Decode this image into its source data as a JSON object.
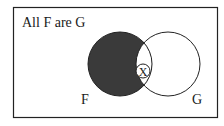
{
  "diagram": {
    "title": "All F are G",
    "circles": [
      {
        "label": "F",
        "shaded": "outside-G"
      },
      {
        "label": "G",
        "shaded": "none"
      }
    ],
    "marker": {
      "symbol": "X",
      "region": "F-and-G"
    },
    "colors": {
      "shade": "#3a3a3a",
      "stroke": "#222222",
      "background": "#ffffff"
    }
  }
}
